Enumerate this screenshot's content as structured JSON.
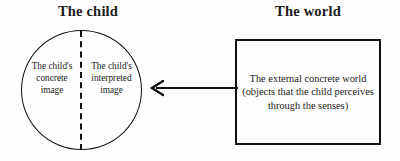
{
  "diagram": {
    "title_left": "The child",
    "title_right": "The world",
    "child_circle": {
      "left_half_label": "The child's concrete image",
      "right_half_label": "The child's interpreted image",
      "divider_style": "dashed-vertical"
    },
    "world_box": {
      "label": "The external concrete world (objects that the child perceives through the senses)"
    },
    "arrow": {
      "direction": "left",
      "from": "The world",
      "to": "The child"
    },
    "colors": {
      "stroke": "#111111",
      "text": "#1a1a1a",
      "background": "#fefefe"
    }
  }
}
